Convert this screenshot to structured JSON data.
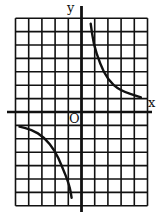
{
  "chart_data": {
    "type": "line",
    "title": "",
    "xlabel": "x",
    "ylabel": "y",
    "origin_label": "O",
    "grid": true,
    "grid_columns": 10,
    "grid_rows": 14,
    "xlim": [
      -5,
      5
    ],
    "ylim": [
      -7,
      7
    ],
    "series": [
      {
        "name": "branch-quadrant-I",
        "points": [
          [
            0.7,
            6.6
          ],
          [
            0.9,
            5.1
          ],
          [
            1.4,
            3.6
          ],
          [
            2.0,
            2.4
          ],
          [
            2.9,
            1.6
          ],
          [
            4.5,
            1.1
          ]
        ]
      },
      {
        "name": "branch-quadrant-III",
        "points": [
          [
            -4.7,
            -1.1
          ],
          [
            -3.8,
            -1.3
          ],
          [
            -2.8,
            -1.9
          ],
          [
            -2.0,
            -2.9
          ],
          [
            -1.5,
            -4.0
          ],
          [
            -0.9,
            -5.5
          ],
          [
            -0.75,
            -6.4
          ]
        ]
      }
    ]
  },
  "labels": {
    "x_axis": "x",
    "y_axis": "y",
    "origin": "O"
  }
}
